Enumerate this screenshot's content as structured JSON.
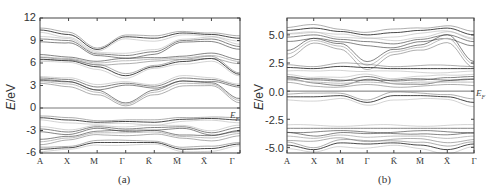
{
  "chart_data": [
    {
      "type": "line",
      "panel_label": "(a)",
      "title": "",
      "xlabel": "",
      "ylabel": "E/eV",
      "ylim": [
        -6,
        12
      ],
      "yticks": [
        12,
        9,
        6,
        3,
        0,
        -3,
        -6
      ],
      "categories": [
        "A",
        "X",
        "M",
        "Γ",
        "K̄",
        "M̄",
        "X̄",
        "Γ"
      ],
      "reference_line": {
        "y": 0,
        "label": "E_F"
      },
      "grid": false,
      "series": [
        {
          "name": "conduction band (upper)",
          "values": [
            10.4,
            9.8,
            7.8,
            9.5,
            9.3,
            10.0,
            9.8,
            9.3
          ]
        },
        {
          "name": "conduction band (upper 2)",
          "values": [
            9.2,
            9.0,
            7.2,
            7.0,
            7.5,
            9.0,
            9.2,
            8.2
          ]
        },
        {
          "name": "conduction band (mid)",
          "values": [
            6.8,
            6.6,
            6.0,
            6.3,
            6.5,
            6.7,
            7.0,
            6.2
          ]
        },
        {
          "name": "conduction band (dispersive)",
          "values": [
            6.5,
            6.3,
            5.5,
            4.3,
            5.5,
            6.2,
            6.6,
            4.5
          ]
        },
        {
          "name": "conduction band (lower)",
          "values": [
            4.0,
            3.8,
            2.8,
            3.3,
            2.9,
            4.0,
            3.8,
            3.0
          ]
        },
        {
          "name": "conduction band (lowest)",
          "values": [
            3.5,
            3.2,
            2.1,
            0.5,
            2.1,
            3.3,
            3.2,
            1.0
          ]
        },
        {
          "name": "valence band (top)",
          "values": [
            -1.3,
            -1.6,
            -1.9,
            -1.8,
            -1.9,
            -1.5,
            -1.4,
            -1.6
          ]
        },
        {
          "name": "valence band (mid)",
          "values": [
            -2.8,
            -3.2,
            -2.5,
            -2.8,
            -2.6,
            -2.5,
            -3.3,
            -2.6
          ]
        },
        {
          "name": "valence band (lower)",
          "values": [
            -4.5,
            -4.0,
            -3.3,
            -3.3,
            -3.2,
            -3.8,
            -4.0,
            -3.4
          ]
        },
        {
          "name": "valence band (bottom)",
          "values": [
            -5.5,
            -5.3,
            -4.6,
            -4.6,
            -4.6,
            -5.5,
            -5.4,
            -4.8
          ]
        }
      ]
    },
    {
      "type": "line",
      "panel_label": "(b)",
      "title": "",
      "xlabel": "",
      "ylabel": "E/eV",
      "ylim": [
        -5.5,
        6.5
      ],
      "yticks": [
        5.0,
        2.5,
        0.0,
        -2.5,
        -5.0
      ],
      "categories": [
        "A",
        "X",
        "M",
        "Γ",
        "K̄",
        "M̄",
        "X̄",
        "Γ"
      ],
      "reference_line": {
        "y": 0,
        "label": "E_F"
      },
      "grid": false,
      "series": [
        {
          "name": "conduction band (upper)",
          "values": [
            5.4,
            5.6,
            5.3,
            5.0,
            5.2,
            5.4,
            5.6,
            5.0
          ]
        },
        {
          "name": "conduction band (upper 2)",
          "values": [
            4.8,
            5.0,
            4.6,
            4.4,
            4.2,
            4.6,
            5.0,
            4.4
          ]
        },
        {
          "name": "conduction band (dispersive)",
          "values": [
            3.3,
            4.5,
            4.0,
            2.3,
            3.5,
            3.9,
            4.7,
            2.4
          ]
        },
        {
          "name": "impurity band (upper)",
          "values": [
            2.1,
            2.0,
            2.2,
            2.1,
            2.0,
            2.0,
            2.0,
            2.0
          ]
        },
        {
          "name": "impurity band (mid)",
          "values": [
            1.3,
            1.0,
            0.9,
            1.3,
            0.9,
            1.0,
            1.2,
            1.3
          ]
        },
        {
          "name": "impurity band (lower)",
          "values": [
            1.0,
            0.8,
            0.7,
            0.8,
            0.7,
            0.8,
            0.8,
            0.8
          ]
        },
        {
          "name": "occupied impurity band",
          "values": [
            -0.5,
            -0.5,
            -0.4,
            -1.0,
            -0.4,
            -0.4,
            -0.5,
            -1.0
          ]
        },
        {
          "name": "valence band (top)",
          "values": [
            -3.3,
            -3.3,
            -3.3,
            -3.3,
            -3.3,
            -3.3,
            -3.3,
            -3.3
          ]
        },
        {
          "name": "valence band (mid)",
          "values": [
            -4.0,
            -4.2,
            -3.9,
            -4.1,
            -4.0,
            -4.0,
            -4.2,
            -4.0
          ]
        },
        {
          "name": "valence band (bottom)",
          "values": [
            -4.8,
            -5.2,
            -4.6,
            -4.7,
            -4.6,
            -4.8,
            -5.2,
            -4.7
          ]
        }
      ]
    }
  ],
  "panels": {
    "a": {
      "caption": "(a)",
      "ylabel_italic": "E",
      "ylabel_rest": "/eV",
      "yticks": [
        "12",
        "9",
        "6",
        "3",
        "0",
        "-3",
        "-6"
      ],
      "xticks": [
        "A",
        "X",
        "M",
        "Γ",
        "K̄",
        "M̄",
        "X̄",
        "Γ"
      ],
      "ef_label": "E",
      "ef_sub": "F"
    },
    "b": {
      "caption": "(b)",
      "ylabel_italic": "E",
      "ylabel_rest": "/eV",
      "yticks": [
        "5.0",
        "2.5",
        "0.0",
        "-2.5",
        "-5.0"
      ],
      "xticks": [
        "A",
        "X",
        "M",
        "Γ",
        "K̄",
        "M̄",
        "X̄",
        "Γ"
      ],
      "ef_label": "E",
      "ef_sub": "F"
    }
  },
  "colors": {
    "axis": "#444444",
    "band_dark": "#333333",
    "band_mid": "#777777",
    "band_light": "#b5b5b5",
    "fermi": "#555555"
  }
}
